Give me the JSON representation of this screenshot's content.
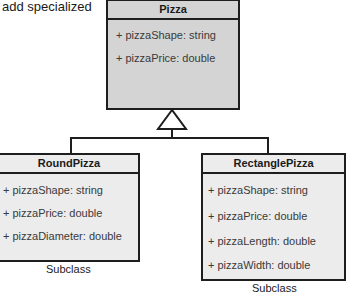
{
  "caption": "add specialized",
  "superclass": {
    "name": "Pizza",
    "attributes": [
      "+ pizzaShape: string",
      "+ pizzaPrice: double"
    ]
  },
  "subclasses": [
    {
      "name": "RoundPizza",
      "attributes": [
        "+ pizzaShape: string",
        "+ pizzaPrice: double",
        "+ pizzaDiameter: double"
      ],
      "label": "Subclass"
    },
    {
      "name": "RectanglePizza",
      "attributes": [
        "+ pizzaShape: string",
        "+ pizzaPrice: double",
        "+ pizzaLength: double",
        "+ pizzaWidth: double"
      ],
      "label": "Subclass"
    }
  ],
  "colors": {
    "superclass_fill": "#d4d4d4",
    "subclass_fill": "#ececec",
    "stroke": "#1e1e1e"
  }
}
